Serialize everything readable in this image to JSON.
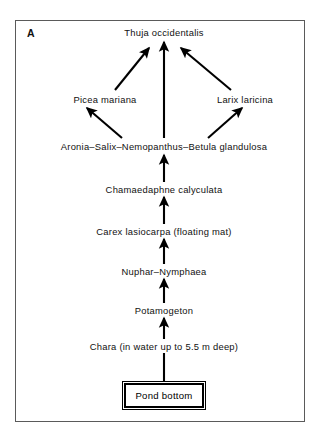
{
  "figure": {
    "panel_letter": "A",
    "background_color": "#ffffff",
    "frame_color": "#5a5a5a",
    "ink_color": "#000000"
  },
  "nodes": [
    {
      "id": "thuja",
      "label": "Thuja occidentalis",
      "x": 164,
      "y": 32
    },
    {
      "id": "picea",
      "label": "Picea mariana",
      "x": 105,
      "y": 99
    },
    {
      "id": "larix",
      "label": "Larix laricina",
      "x": 245,
      "y": 99
    },
    {
      "id": "aronia",
      "label": "Aronia–Salix–Nemopanthus–Betula glandulosa",
      "x": 164,
      "y": 146
    },
    {
      "id": "chamaedaphne",
      "label": "Chamaedaphne calyculata",
      "x": 164,
      "y": 189
    },
    {
      "id": "carex",
      "label": "Carex lasiocarpa (floating mat)",
      "x": 164,
      "y": 231
    },
    {
      "id": "nuphar",
      "label": "Nuphar–Nymphaea",
      "x": 164,
      "y": 271
    },
    {
      "id": "potamogeton",
      "label": "Potamogeton",
      "x": 164,
      "y": 310
    },
    {
      "id": "chara",
      "label": "Chara (in water up to 5.5 m deep)",
      "x": 164,
      "y": 346
    },
    {
      "id": "pond-bottom",
      "label": "Pond bottom",
      "x": 164,
      "y": 395
    }
  ],
  "edges": [
    {
      "id": "aronia-to-picea",
      "from": "aronia",
      "to": "picea",
      "arrow": true,
      "style": "solid"
    },
    {
      "id": "aronia-to-larix",
      "from": "aronia",
      "to": "larix",
      "arrow": true,
      "style": "solid"
    },
    {
      "id": "aronia-to-thuja",
      "from": "aronia",
      "to": "thuja",
      "arrow": true,
      "style": "solid"
    },
    {
      "id": "picea-to-thuja",
      "from": "picea",
      "to": "thuja",
      "arrow": true,
      "style": "solid"
    },
    {
      "id": "larix-to-thuja",
      "from": "larix",
      "to": "thuja",
      "arrow": true,
      "style": "solid"
    },
    {
      "id": "chamaedaphne-to-aronia",
      "from": "chamaedaphne",
      "to": "aronia",
      "arrow": true,
      "style": "solid"
    },
    {
      "id": "carex-to-chamaedaphne",
      "from": "carex",
      "to": "chamaedaphne",
      "arrow": true,
      "style": "solid"
    },
    {
      "id": "nuphar-to-carex",
      "from": "nuphar",
      "to": "carex",
      "arrow": true,
      "style": "solid"
    },
    {
      "id": "potamogeton-to-nuphar",
      "from": "potamogeton",
      "to": "nuphar",
      "arrow": true,
      "style": "solid"
    },
    {
      "id": "chara-to-potamogeton",
      "from": "chara",
      "to": "potamogeton",
      "arrow": true,
      "style": "solid"
    },
    {
      "id": "pond-bottom-to-chara",
      "from": "pond-bottom",
      "to": "chara",
      "arrow": false,
      "style": "solid"
    }
  ]
}
